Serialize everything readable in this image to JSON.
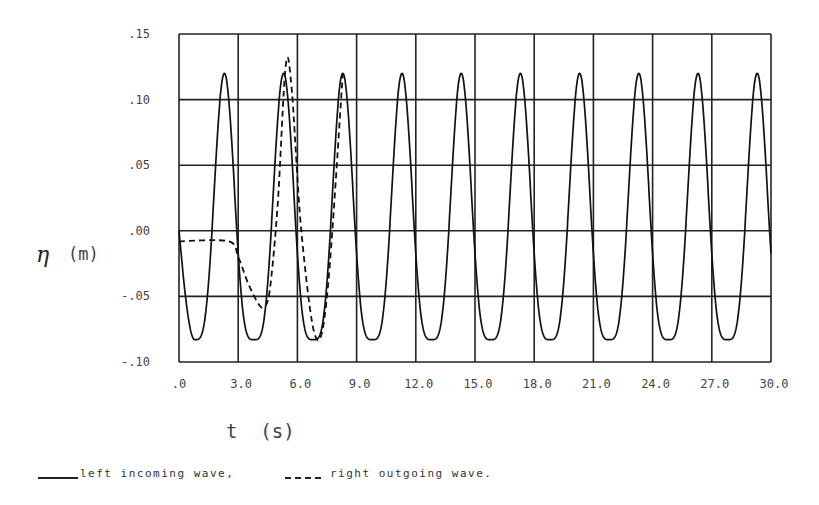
{
  "chart_data": {
    "type": "line",
    "title": "",
    "xlabel": "t (s)",
    "ylabel_symbol": "η",
    "ylabel_unit": "(m)",
    "xlim": [
      0,
      30
    ],
    "ylim": [
      -0.1,
      0.15
    ],
    "grid": true,
    "x_ticks": [
      ".0",
      "3.0",
      "6.0",
      "9.0",
      "12.0",
      "15.0",
      "18.0",
      "21.0",
      "24.0",
      "27.0",
      "30.0"
    ],
    "y_ticks": [
      ".15",
      ".10",
      ".05",
      ".00",
      "-.05",
      "-.10"
    ],
    "legend_position": "bottom",
    "series": [
      {
        "name": "left incoming wave,",
        "style": "solid",
        "period": 3.0,
        "crest": 0.12,
        "trough": -0.083,
        "first_crest_t": 2.3,
        "points": [
          [
            0,
            0.0
          ],
          [
            0.8,
            -0.083
          ],
          [
            2.3,
            0.12
          ],
          [
            3.8,
            -0.08
          ],
          [
            5.3,
            0.12
          ],
          [
            6.8,
            -0.08
          ],
          [
            8.3,
            0.12
          ],
          [
            9.8,
            -0.08
          ],
          [
            11.3,
            0.12
          ],
          [
            12.8,
            -0.08
          ],
          [
            14.3,
            0.12
          ],
          [
            15.8,
            -0.08
          ],
          [
            17.3,
            0.12
          ],
          [
            18.8,
            -0.08
          ],
          [
            20.3,
            0.12
          ],
          [
            21.8,
            -0.08
          ],
          [
            23.3,
            0.12
          ],
          [
            24.8,
            -0.08
          ],
          [
            26.3,
            0.12
          ],
          [
            27.8,
            -0.08
          ],
          [
            29.3,
            0.12
          ],
          [
            30.0,
            0.0
          ]
        ]
      },
      {
        "name": "right outgoing wave.",
        "style": "dashed",
        "points": [
          [
            0,
            -0.008
          ],
          [
            2.5,
            -0.008
          ],
          [
            3.0,
            -0.02
          ],
          [
            3.5,
            -0.04
          ],
          [
            4.0,
            -0.055
          ],
          [
            4.3,
            -0.058
          ],
          [
            4.6,
            -0.045
          ],
          [
            5.0,
            0.02
          ],
          [
            5.4,
            0.125
          ],
          [
            5.7,
            0.11
          ],
          [
            6.2,
            0.0
          ],
          [
            6.9,
            -0.08
          ],
          [
            7.5,
            -0.05
          ],
          [
            8.3,
            0.12
          ]
        ]
      }
    ]
  },
  "legend": {
    "solid_label": "left incoming wave,",
    "dashed_label": "right outgoing wave."
  },
  "axes": {
    "x_label": "t  (s)",
    "y_symbol": "η",
    "y_unit": "(m)"
  }
}
